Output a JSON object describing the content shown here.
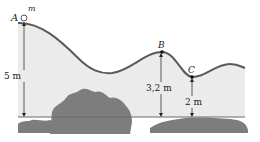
{
  "diagram": {
    "points": {
      "A": {
        "label": "A",
        "mass_label": "m"
      },
      "B": {
        "label": "B"
      },
      "C": {
        "label": "C"
      }
    },
    "heights": {
      "A": "5 m",
      "B": "3,2 m",
      "C": "2 m"
    },
    "colors": {
      "track": "#5a5a5a",
      "fill": "#ebebeb",
      "ground": "#6b6b6b",
      "shrub": "#7d7d7d",
      "text": "#222222"
    }
  }
}
